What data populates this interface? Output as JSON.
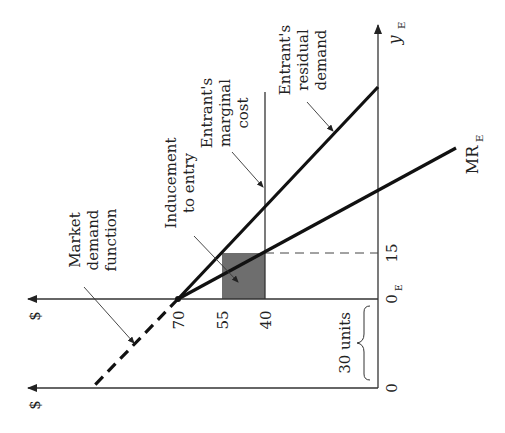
{
  "diagram": {
    "orientation": "rotated-90-ccw",
    "axes": {
      "price_axis_top_label": "$",
      "price_axis_bottom_label": "$",
      "quantity_axis_label": "y",
      "quantity_axis_subscript": "E"
    },
    "ticks": {
      "price_70": "70",
      "price_55": "55",
      "price_40": "40",
      "qty_zero": "0",
      "qty_zero_E": "0",
      "qty_zero_E_sub": "E",
      "qty_15": "15"
    },
    "labels": {
      "market_demand": [
        "Market",
        "demand",
        "function"
      ],
      "inducement": [
        "Inducement",
        "to entry"
      ],
      "marginal_cost": [
        "Entrant's",
        "marginal",
        "cost"
      ],
      "residual_demand": [
        "Entrant's",
        "residual",
        "demand"
      ],
      "mr": "MR",
      "mr_sub": "E",
      "offset": "30 units"
    },
    "colors": {
      "line": "#111111",
      "axis": "#333333",
      "shade": "#6e6e6e"
    }
  }
}
